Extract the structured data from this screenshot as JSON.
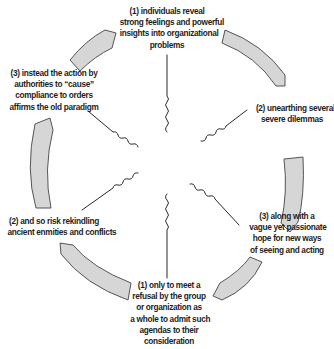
{
  "diagram": {
    "type": "cycle",
    "colors": {
      "arrow_fill": "#d6d6d6",
      "arrow_stroke": "#555555",
      "connector": "#2a2a2a",
      "text": "#1e1e1e",
      "background": "#ffffff"
    },
    "nodes": [
      {
        "id": "top",
        "lines": [
          "(1) individuals reveal",
          "strong feelings and powerful",
          "insights into organizational",
          "problems"
        ]
      },
      {
        "id": "upper-right",
        "lines": [
          "(2) unearthing several",
          "severe dilemmas"
        ]
      },
      {
        "id": "lower-right",
        "lines": [
          "(3) along with a",
          "vague yet passionate",
          "hope for new ways",
          "of seeing and acting"
        ]
      },
      {
        "id": "bottom",
        "lines": [
          "(1) only to meet a",
          "refusal by the group",
          "or organization as",
          "a whole to admit such",
          "agendas to their",
          "consideration"
        ]
      },
      {
        "id": "lower-left",
        "lines": [
          "(2) and so risk rekindling",
          "ancient enmities and conflicts"
        ]
      },
      {
        "id": "upper-left",
        "lines": [
          "(3) instead the action by",
          "authorities to “cause”",
          "compliance to orders",
          "affirms the old paradigm"
        ]
      }
    ],
    "arrows": [
      {
        "from": "upper-left",
        "to": "top",
        "direction": "clockwise"
      },
      {
        "from": "top",
        "to": "upper-right",
        "direction": "clockwise"
      },
      {
        "from": "upper-right",
        "to": "lower-right",
        "direction": "clockwise"
      },
      {
        "from": "lower-right",
        "to": "bottom",
        "direction": "clockwise"
      },
      {
        "from": "bottom",
        "to": "lower-left",
        "direction": "clockwise"
      },
      {
        "from": "lower-left",
        "to": "upper-left",
        "direction": "clockwise"
      }
    ],
    "connectors": [
      "top",
      "upper-right",
      "lower-right",
      "bottom",
      "lower-left",
      "upper-left"
    ]
  }
}
